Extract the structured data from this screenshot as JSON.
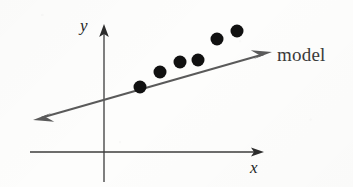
{
  "figure": {
    "type": "scatter-with-fit-line",
    "background_color": "#fdfdfc",
    "axis_color": "#3c3c3c",
    "model_line_color": "#5a5a5a",
    "point_color": "#111111",
    "labels": {
      "y_axis": "y",
      "x_axis": "x",
      "model_line": "model"
    }
  },
  "chart_data": {
    "type": "scatter",
    "title": "",
    "xlabel": "x",
    "ylabel": "y",
    "grid": false,
    "legend": null,
    "annotations": [
      {
        "text": "model",
        "target": "regression-line",
        "x": 277,
        "y": 55
      }
    ],
    "axes": {
      "x_axis_line": {
        "x1": 30,
        "y1": 152,
        "x2": 265,
        "y2": 152,
        "arrow": "right"
      },
      "y_axis_line": {
        "x1": 104,
        "y1": 182,
        "x2": 104,
        "y2": 24,
        "arrow": "up"
      },
      "origin": {
        "x": 104,
        "y": 152
      }
    },
    "series": [
      {
        "name": "observations",
        "marker": "filled-circle",
        "marker_size_px": 13,
        "color": "#111111",
        "points_px": [
          {
            "x": 140,
            "y": 87
          },
          {
            "x": 160,
            "y": 72
          },
          {
            "x": 180,
            "y": 62
          },
          {
            "x": 198,
            "y": 60
          },
          {
            "x": 217,
            "y": 39
          },
          {
            "x": 237,
            "y": 31
          }
        ]
      },
      {
        "name": "model",
        "type": "line",
        "color": "#5a5a5a",
        "arrows": "both",
        "endpoints_px": [
          {
            "x": 33,
            "y": 120
          },
          {
            "x": 272,
            "y": 52
          }
        ]
      }
    ]
  }
}
